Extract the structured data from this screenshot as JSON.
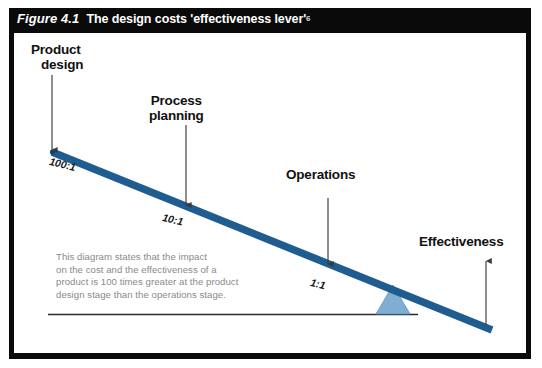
{
  "figure": {
    "number": "Figure 4.1",
    "title": "The design costs 'effectiveness lever'",
    "footnote_marker": "6"
  },
  "colors": {
    "frame": "#0a0a0a",
    "title_bar": "#0a0a0a",
    "title_text": "#ffffff",
    "lever_bar": "#1f5c8f",
    "fulcrum": "#7fadd4",
    "fulcrum_edge": "#5b93c2",
    "arrow": "#3a3a3a",
    "baseline": "#2b2b2b",
    "body_text": "#8a8a8a",
    "callout_text": "#111111",
    "canvas": "#ffffff"
  },
  "callouts": [
    {
      "id": "product-design",
      "line1": "Product",
      "line2": "design"
    },
    {
      "id": "process-planning",
      "line1": "Process",
      "line2": "planning"
    },
    {
      "id": "operations",
      "line1": "Operations",
      "line2": ""
    },
    {
      "id": "effectiveness",
      "line1": "Effectiveness",
      "line2": ""
    }
  ],
  "ratios": [
    {
      "id": "product-design-ratio",
      "label": "100:1"
    },
    {
      "id": "process-planning-ratio",
      "label": "10:1"
    },
    {
      "id": "operations-ratio",
      "label": "1:1"
    }
  ],
  "description": {
    "line1": "This diagram states that the impact",
    "line2": "on the cost and the effectiveness of a",
    "line3": "product is 100 times greater at the product",
    "line4": "design stage than the operations stage."
  },
  "icons": {
    "arrow_down": "arrow-down-icon",
    "arrow_up": "arrow-up-icon",
    "fulcrum": "triangle-fulcrum-icon",
    "lever": "lever-bar-icon"
  }
}
